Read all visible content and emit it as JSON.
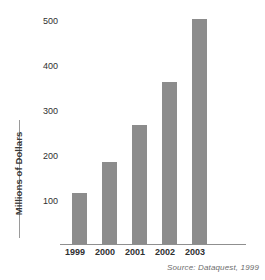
{
  "chart_data": {
    "type": "bar",
    "title": "",
    "subtitle": "",
    "xlabel": "",
    "ylabel": "Millions of Dollars",
    "categories": [
      "1999",
      "2000",
      "2001",
      "2002",
      "2003"
    ],
    "values": [
      110,
      178,
      258,
      352,
      489
    ],
    "series": [
      {
        "name": "Revenue",
        "values": [
          110,
          178,
          258,
          352,
          489
        ]
      }
    ],
    "ylim": [
      0,
      500
    ],
    "yticks": [
      100,
      200,
      300,
      400,
      500
    ],
    "ytick_labels": [
      "100",
      "200",
      "300",
      "400",
      "500"
    ],
    "xtick_labels": [
      "1999",
      "2000",
      "2001",
      "2002",
      "2003"
    ],
    "grid": false,
    "legend": null,
    "legend_position": "none",
    "annotations": [
      "Source: Dataquest, 1999"
    ],
    "bar_color": "#8c8c8c",
    "axis_color": "#8f8f8f",
    "text_color": "#2f2f2f",
    "background": "#ffffff"
  },
  "footer": {
    "source_note": "Source: Dataquest, 1999"
  },
  "axis": {
    "y_label": "Millions of Dollars"
  }
}
